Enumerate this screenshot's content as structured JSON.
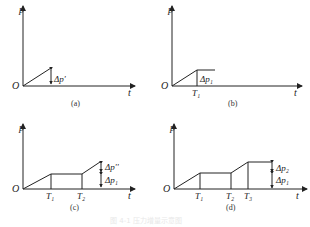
{
  "figure": {
    "caption_faint": "图 4-1  压力增量示意图",
    "panels": [
      {
        "id": "a",
        "label": "(a)",
        "y_axis": "p",
        "x_axis": "t",
        "origin": "O",
        "annotations": [
          "Δp'"
        ],
        "time_marks": []
      },
      {
        "id": "b",
        "label": "(b)",
        "y_axis": "p",
        "x_axis": "t",
        "origin": "O",
        "annotations": [
          "Δp₁"
        ],
        "time_marks": [
          "T₁"
        ]
      },
      {
        "id": "c",
        "label": "(c)",
        "y_axis": "p",
        "x_axis": "t",
        "origin": "O",
        "annotations": [
          "Δp''",
          "Δp₁"
        ],
        "time_marks": [
          "T₁",
          "T₂"
        ]
      },
      {
        "id": "d",
        "label": "(d)",
        "y_axis": "p",
        "x_axis": "t",
        "origin": "O",
        "annotations": [
          "Δp₂",
          "Δp₁"
        ],
        "time_marks": [
          "T₁",
          "T₂",
          "T₃"
        ]
      }
    ]
  }
}
